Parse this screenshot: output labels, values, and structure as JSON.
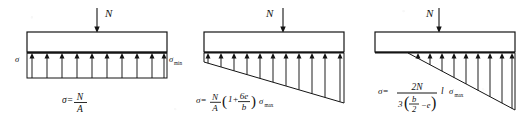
{
  "figure": {
    "background_color": "#ffffff",
    "line_color": "#141414",
    "width": 531,
    "height": 124
  },
  "diagrams": [
    {
      "id": "case-1",
      "name": "uniform-stress-distribution",
      "load_label": "N",
      "left_stress_label": "σ",
      "right_stress_label": "σ",
      "right_stress_sub": "min",
      "distribution_type": "uniform",
      "arrow_count": 10,
      "formula": {
        "lhs": "σ=",
        "numerator": "N",
        "denominator": "A"
      }
    },
    {
      "id": "case-2",
      "name": "trapezoidal-stress-distribution",
      "load_label": "N",
      "distribution_type": "trapezoidal",
      "arrow_count": 11,
      "formula": {
        "lhs": "σ=",
        "numerator": "N",
        "denominator": "A",
        "paren_open": "(",
        "one_plus": "1+",
        "frac_num": "6e",
        "frac_den": "b",
        "paren_close": ")",
        "tail": "σ",
        "tail_sub": "max"
      }
    },
    {
      "id": "case-3",
      "name": "triangular-stress-distribution",
      "load_label": "N",
      "distribution_type": "triangular",
      "arrow_count": 9,
      "formula": {
        "lhs": "σ=",
        "numerator": "2N",
        "den_lead": "3",
        "den_paren_open": "(",
        "den_frac_num": "b",
        "den_frac_den": "2",
        "den_minus_e": "−e",
        "den_paren_close": ")",
        "tail_l": "l",
        "tail": "σ",
        "tail_sub": "max"
      }
    }
  ]
}
